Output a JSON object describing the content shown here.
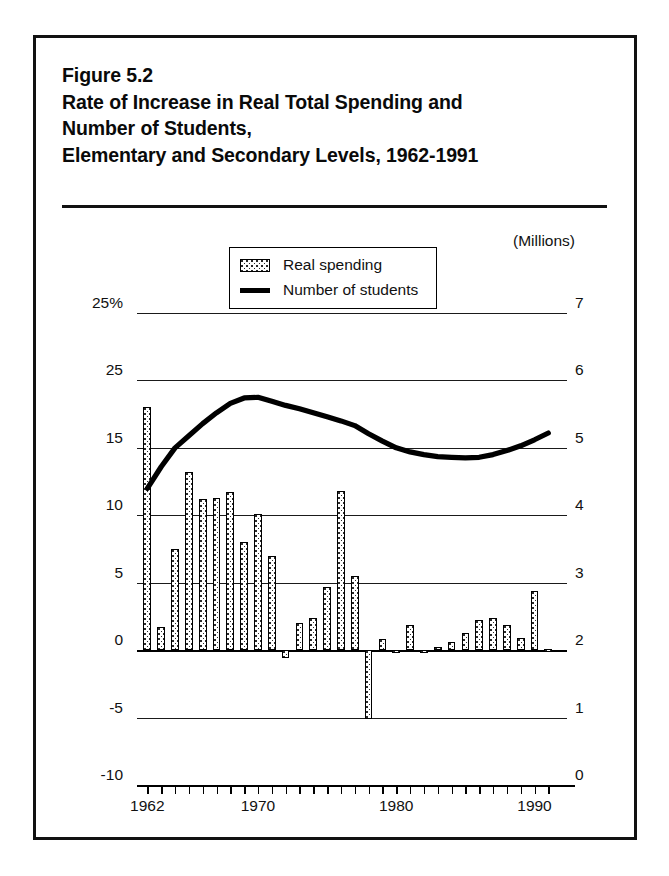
{
  "figure": {
    "label": "Figure 5.2",
    "title_lines": [
      "Figure 5.2",
      "Rate of Increase in Real Total Spending and",
      "Number of Students,",
      "Elementary and Secondary Levels, 1962-1991"
    ]
  },
  "legend": {
    "position": "inside-top-center",
    "items": [
      {
        "label": "Real spending",
        "marker": "stippled-bar-swatch"
      },
      {
        "label": "Number of students",
        "marker": "solid-black-line"
      }
    ]
  },
  "axes": {
    "left_caption": "",
    "left_tick_labels": [
      "25%",
      "25",
      "15",
      "10",
      "5",
      "0",
      "-5",
      "-10"
    ],
    "right_caption": "(Millions)",
    "right_tick_labels": [
      "7",
      "6",
      "5",
      "4",
      "3",
      "2",
      "1",
      "0"
    ],
    "x_tick_labels": [
      "1962",
      "1970",
      "1980",
      "1990"
    ]
  },
  "chart_data": {
    "type": "bar",
    "title": "Rate of Increase in Real Total Spending and Number of Students, Elementary and Secondary Levels, 1962-1991",
    "xlabel": "",
    "ylabel": "Rate of increase (percent)",
    "y2label": "Number of students (Millions)",
    "grid": true,
    "legend_position": "inside-top-center",
    "ylim": [
      -10,
      25
    ],
    "y2lim": [
      0,
      7
    ],
    "yticks": [
      -10,
      -5,
      0,
      5,
      10,
      15,
      25,
      25
    ],
    "ytick_labels": [
      "-10",
      "-5",
      "0",
      "5",
      "10",
      "15",
      "25",
      "25%"
    ],
    "y2ticks": [
      0,
      1,
      2,
      3,
      4,
      5,
      6,
      7
    ],
    "y2tick_labels": [
      "0",
      "1",
      "2",
      "3",
      "4",
      "5",
      "6",
      "7"
    ],
    "xlim": [
      1961.3,
      1991.7
    ],
    "categories": [
      "1962",
      "1963",
      "1964",
      "1965",
      "1966",
      "1967",
      "1968",
      "1969",
      "1970",
      "1971",
      "1972",
      "1973",
      "1974",
      "1975",
      "1976",
      "1977",
      "1978",
      "1979",
      "1980",
      "1981",
      "1982",
      "1983",
      "1984",
      "1985",
      "1986",
      "1987",
      "1988",
      "1989",
      "1990",
      "1991"
    ],
    "series": [
      {
        "name": "Real spending",
        "type": "bar",
        "axis": "left",
        "unit": "percent increase",
        "values": [
          21.0,
          1.7,
          7.5,
          13.2,
          11.2,
          11.3,
          11.7,
          8.0,
          10.1,
          7.0,
          -0.6,
          2.0,
          2.4,
          4.7,
          11.8,
          5.5,
          -5.1,
          0.8,
          0.0,
          1.9,
          0.0,
          0.2,
          0.6,
          1.3,
          2.2,
          2.4,
          1.9,
          0.9,
          4.4,
          0.1
        ]
      },
      {
        "name": "Number of students",
        "type": "line",
        "axis": "right",
        "unit": "millions",
        "values": [
          4.4,
          4.72,
          5.0,
          5.18,
          5.36,
          5.52,
          5.66,
          5.74,
          5.75,
          5.69,
          5.63,
          5.58,
          5.52,
          5.46,
          5.4,
          5.33,
          5.21,
          5.1,
          5.0,
          4.94,
          4.9,
          4.87,
          4.86,
          4.85,
          4.86,
          4.9,
          4.96,
          5.03,
          5.12,
          5.22
        ]
      }
    ]
  },
  "style": {
    "ink": "#111111",
    "frame": "#111111",
    "bar_fill": "#ffffff",
    "bar_pattern": "#2a2a2a",
    "line_color": "#000000"
  }
}
